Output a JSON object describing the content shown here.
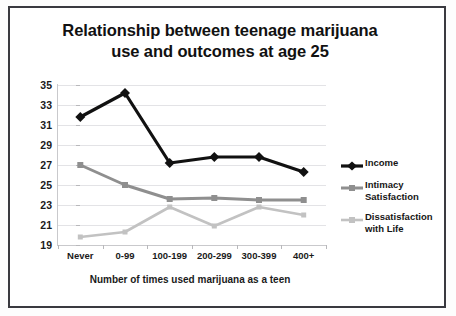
{
  "chart_data": {
    "type": "line",
    "title": "Relationship between teenage marijuana use and outcomes at age 25",
    "title_line1": "Relationship between teenage marijuana",
    "title_line2": "use and outcomes at age 25",
    "xlabel": "Number of times used marijuana as a teen",
    "ylabel": "",
    "categories": [
      "Never",
      "0-99",
      "100-199",
      "200-299",
      "300-399",
      "400+"
    ],
    "ylim": [
      19,
      35
    ],
    "yticks": [
      19,
      21,
      23,
      25,
      27,
      29,
      31,
      33,
      35
    ],
    "grid": true,
    "legend_position": "right",
    "series": [
      {
        "name": "Income",
        "color": "#111111",
        "marker": "diamond",
        "values": [
          31.8,
          34.2,
          27.2,
          27.8,
          27.8,
          26.3
        ]
      },
      {
        "name": "Intimacy Satisfaction",
        "color": "#8f8f8f",
        "marker": "square",
        "values": [
          27.0,
          25.0,
          23.6,
          23.7,
          23.5,
          23.5
        ]
      },
      {
        "name": "Dissatisfaction with Life",
        "color": "#c2c2c2",
        "marker": "square",
        "values": [
          19.8,
          20.3,
          22.8,
          20.9,
          22.8,
          22.0
        ]
      }
    ],
    "legend_entries": [
      {
        "label": "Income",
        "label_lines": [
          "Income"
        ]
      },
      {
        "label": "Intimacy Satisfaction",
        "label_lines": [
          "Intimacy",
          "Satisfaction"
        ]
      },
      {
        "label": "Dissatisfaction with Life",
        "label_lines": [
          "Dissatisfaction",
          "with Life"
        ]
      }
    ]
  },
  "colors": {
    "income": "#111111",
    "intimacy": "#8f8f8f",
    "dissatisfaction": "#c2c2c2",
    "gridline": "#e3e3e6",
    "frame": "#3a3a40",
    "background": "#ffffff"
  }
}
